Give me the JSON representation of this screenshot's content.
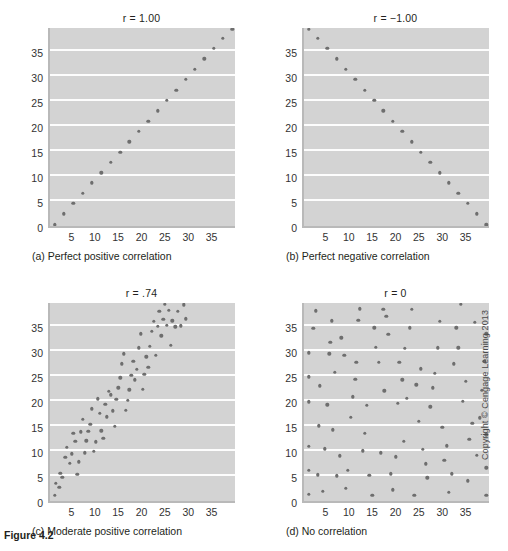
{
  "figure": {
    "label": "Figure 4.2",
    "copyright": "Copyright © Cengage Learning 2013"
  },
  "axes": {
    "y_ticks": [
      "0",
      "5",
      "10",
      "15",
      "20",
      "25",
      "30",
      "35"
    ],
    "x_ticks": [
      "5",
      "10",
      "15",
      "20",
      "25",
      "30",
      "35"
    ],
    "xlim": [
      0,
      40
    ],
    "ylim": [
      0,
      40
    ]
  },
  "panels": [
    {
      "key": "a",
      "title": "r = 1.00",
      "caption": "(a) Perfect positive correlation"
    },
    {
      "key": "b",
      "title": "r = −1.00",
      "caption": "(b) Perfect negative correlation"
    },
    {
      "key": "c",
      "title": "r = .74",
      "caption": "(c) Moderate positive correlation"
    },
    {
      "key": "d",
      "title": "r = 0",
      "caption": "(d) No correlation"
    }
  ],
  "chart_data": [
    {
      "type": "scatter",
      "title": "r = 1.00",
      "subtitle": "(a) Perfect positive correlation",
      "xlabel": "",
      "ylabel": "",
      "xlim": [
        0,
        40
      ],
      "ylim": [
        0,
        40
      ],
      "grid": true,
      "correlation": 1.0,
      "x": [
        1,
        3,
        5,
        7,
        9,
        11,
        13,
        15,
        17,
        19,
        21,
        23,
        25,
        27,
        29,
        31,
        33,
        35,
        37,
        39
      ],
      "y": [
        0.3,
        2.5,
        4.6,
        6.6,
        8.7,
        10.7,
        12.8,
        14.8,
        16.9,
        19.0,
        21.0,
        23.1,
        25.2,
        27.2,
        29.4,
        31.4,
        33.5,
        35.6,
        37.6,
        39.4
      ]
    },
    {
      "type": "scatter",
      "title": "r = −1.00",
      "subtitle": "(b) Perfect negative correlation",
      "xlabel": "",
      "ylabel": "",
      "xlim": [
        0,
        40
      ],
      "ylim": [
        0,
        40
      ],
      "grid": true,
      "correlation": -1.0,
      "x": [
        1,
        3,
        5,
        7,
        9,
        11,
        13,
        15,
        17,
        19,
        21,
        23,
        25,
        27,
        29,
        31,
        33,
        35,
        37,
        39
      ],
      "y": [
        39.4,
        37.6,
        35.6,
        33.5,
        31.4,
        29.4,
        27.2,
        25.2,
        23.1,
        21.0,
        19.0,
        16.9,
        14.8,
        12.8,
        10.7,
        8.7,
        6.6,
        4.6,
        2.5,
        0.3
      ]
    },
    {
      "type": "scatter",
      "title": "r = .74",
      "subtitle": "(c) Moderate positive correlation",
      "xlabel": "",
      "ylabel": "",
      "xlim": [
        0,
        40
      ],
      "ylim": [
        0,
        40
      ],
      "grid": true,
      "correlation": 0.74,
      "x": [
        1.0,
        1.3,
        2.0,
        2.2,
        2.6,
        3.3,
        3.6,
        4.2,
        4.6,
        5.0,
        5.4,
        5.8,
        6.2,
        6.6,
        7.0,
        7.4,
        7.8,
        8.2,
        8.6,
        9.0,
        9.4,
        9.8,
        10.2,
        10.6,
        11.0,
        11.4,
        11.8,
        12.2,
        12.6,
        13.0,
        13.4,
        13.8,
        14.2,
        14.6,
        15.0,
        15.4,
        15.8,
        16.2,
        16.6,
        17.0,
        17.4,
        17.8,
        18.2,
        18.6,
        19.0,
        19.4,
        19.8,
        20.2,
        20.6,
        21.0,
        21.4,
        21.8,
        22.2,
        22.6,
        23.0,
        23.4,
        23.8,
        24.2,
        24.6,
        25.0,
        25.4,
        25.8,
        26.2,
        26.8,
        27.4,
        28.0,
        28.6,
        29.0
      ],
      "y": [
        1.2,
        3.6,
        2.8,
        5.6,
        4.8,
        8.8,
        10.8,
        7.6,
        9.5,
        13.6,
        12.0,
        5.4,
        7.9,
        13.9,
        16.4,
        9.7,
        12.1,
        14.0,
        15.4,
        18.5,
        10.0,
        11.9,
        20.5,
        17.6,
        14.1,
        12.6,
        19.4,
        16.9,
        22.0,
        21.3,
        18.1,
        15.0,
        20.4,
        22.7,
        24.7,
        27.5,
        29.5,
        18.2,
        20.2,
        22.3,
        25.2,
        28.0,
        24.3,
        26.4,
        30.7,
        33.5,
        22.4,
        25.4,
        28.9,
        26.8,
        31.0,
        34.0,
        36.0,
        29.2,
        35.0,
        38.0,
        33.1,
        36.4,
        39.4,
        35.2,
        38.2,
        31.2,
        36.1,
        34.9,
        38.0,
        35.1,
        39.3,
        36.5
      ]
    },
    {
      "type": "scatter",
      "title": "r = 0",
      "subtitle": "(d) No correlation",
      "xlabel": "",
      "ylabel": "",
      "xlim": [
        0,
        40
      ],
      "ylim": [
        0,
        40
      ],
      "grid": true,
      "correlation": 0.0,
      "x": [
        1.0,
        1.0,
        1.0,
        1.0,
        1.0,
        1.0,
        2.0,
        2.5,
        3.0,
        3.2,
        3.4,
        4.0,
        4.5,
        5.0,
        5.4,
        5.6,
        6.0,
        6.2,
        6.6,
        7.0,
        7.6,
        8.0,
        8.6,
        9.0,
        9.4,
        10.0,
        10.4,
        11.0,
        11.2,
        11.6,
        12.0,
        12.6,
        13.0,
        13.4,
        14.0,
        14.6,
        15.0,
        15.4,
        16.0,
        16.4,
        17.0,
        17.2,
        17.6,
        18.0,
        18.6,
        19.0,
        19.6,
        20.0,
        20.4,
        21.0,
        21.4,
        21.6,
        22.0,
        22.6,
        23.0,
        23.6,
        24.0,
        24.6,
        25.0,
        25.4,
        26.0,
        26.4,
        27.0,
        27.6,
        28.0,
        28.6,
        29.0,
        29.6,
        30.0,
        30.6,
        31.0,
        31.6,
        32.0,
        32.6,
        33.0,
        33.6,
        34.0,
        34.6,
        35.0,
        35.4,
        36.0,
        36.6,
        37.0,
        37.6,
        38.0,
        38.6,
        39.0,
        39.0,
        39.0,
        39.0
      ],
      "y": [
        1.4,
        6.2,
        11.0,
        19.9,
        24.9,
        29.7,
        34.6,
        38.1,
        5.3,
        15.1,
        23.1,
        2.0,
        10.5,
        19.3,
        29.5,
        31.8,
        36.1,
        14.3,
        25.8,
        5.1,
        9.1,
        32.7,
        29.2,
        2.6,
        6.2,
        16.8,
        20.9,
        24.4,
        27.8,
        36.2,
        38.5,
        10.1,
        13.6,
        19.2,
        5.2,
        1.2,
        34.7,
        30.8,
        27.8,
        9.7,
        38.4,
        22.1,
        37.0,
        33.4,
        5.5,
        2.3,
        8.9,
        19.6,
        27.8,
        24.3,
        12.0,
        30.6,
        20.6,
        34.7,
        38.4,
        1.2,
        23.3,
        16.0,
        26.5,
        10.4,
        7.5,
        4.7,
        18.9,
        22.7,
        25.6,
        30.7,
        36.0,
        14.8,
        8.2,
        11.1,
        1.8,
        5.5,
        27.5,
        34.7,
        30.7,
        39.4,
        20.0,
        24.0,
        4.1,
        12.4,
        15.6,
        35.8,
        9.2,
        16.7,
        22.2,
        28.0,
        1.2,
        6.7,
        13.3,
        33.5
      ]
    }
  ]
}
